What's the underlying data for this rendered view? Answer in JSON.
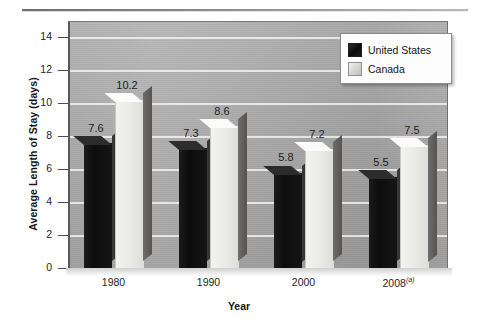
{
  "chart_data": {
    "type": "bar",
    "title": "",
    "xlabel": "Year",
    "ylabel": "Average Length of Stay (days)",
    "categories": [
      "1980",
      "1990",
      "2000",
      "2008"
    ],
    "category_labels": [
      "1980",
      "1990",
      "2000",
      "2008(a)"
    ],
    "category_footnote_marker": "(a)",
    "series": [
      {
        "name": "United States",
        "values": [
          7.6,
          7.3,
          5.8,
          5.5
        ],
        "color": "#111111"
      },
      {
        "name": "Canada",
        "values": [
          10.2,
          8.6,
          7.2,
          7.5
        ],
        "color": "#ececea"
      }
    ],
    "value_labels": {
      "united_states": [
        "7.6",
        "7.3",
        "5.8",
        "5.5"
      ],
      "canada": [
        "10.2",
        "8.6",
        "7.2",
        "7.5"
      ]
    },
    "ylim": [
      0,
      15
    ],
    "yticks": [
      0,
      2,
      4,
      6,
      8,
      10,
      12,
      14
    ],
    "ytick_labels": [
      "0",
      "2",
      "4",
      "6",
      "8",
      "10",
      "12",
      "14"
    ],
    "grid": true,
    "grid_axis": "y",
    "legend_position": "top-right",
    "style": "3d-grayscale"
  },
  "legend": {
    "items": [
      {
        "label": "United States",
        "swatch": "black-swatch-icon"
      },
      {
        "label": "Canada",
        "swatch": "light-swatch-icon"
      }
    ]
  }
}
